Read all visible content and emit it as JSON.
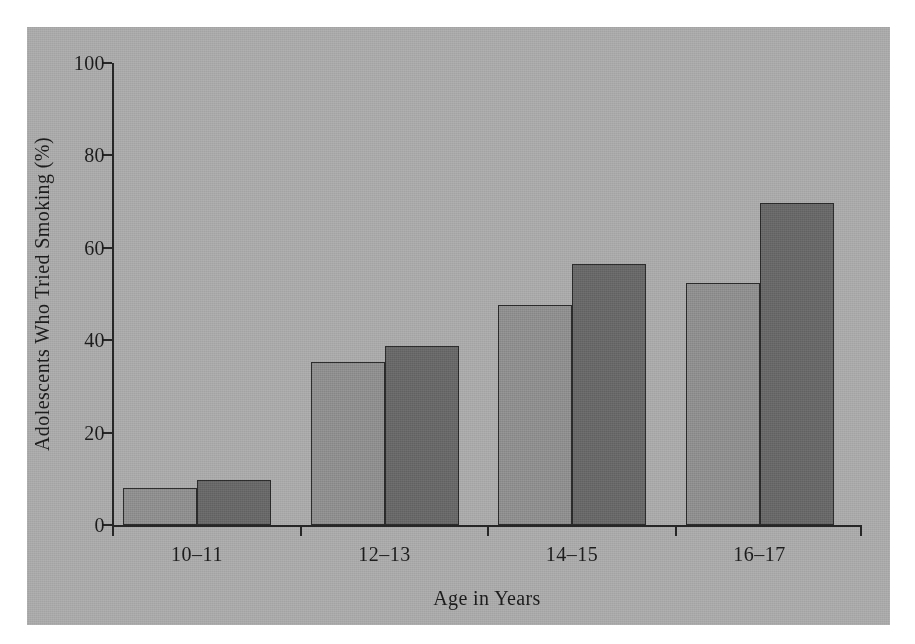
{
  "chart_data": {
    "type": "bar",
    "title": "",
    "subtitle": "",
    "xlabel": "Age in Years",
    "ylabel": "Adolescents Who Tried Smoking (%)",
    "categories": [
      "10–11",
      "12–13",
      "14–15",
      "16–17"
    ],
    "series": [
      {
        "name": "light-bar",
        "color": "#8e8e8e",
        "values": [
          8,
          35.2,
          47.6,
          52.4
        ]
      },
      {
        "name": "dark-bar",
        "color": "#686868",
        "values": [
          9.7,
          38.8,
          56.5,
          69.7
        ]
      }
    ],
    "ylim": [
      0,
      100
    ],
    "yticks": [
      0,
      20,
      40,
      60,
      80,
      100
    ],
    "ytick_labels": [
      "0",
      "20",
      "40",
      "60",
      "80",
      "100"
    ],
    "grid": false,
    "legend": "none",
    "panel_background": "#a9a9a9",
    "page_background": "#ffffff",
    "axis_color": "#262626"
  }
}
